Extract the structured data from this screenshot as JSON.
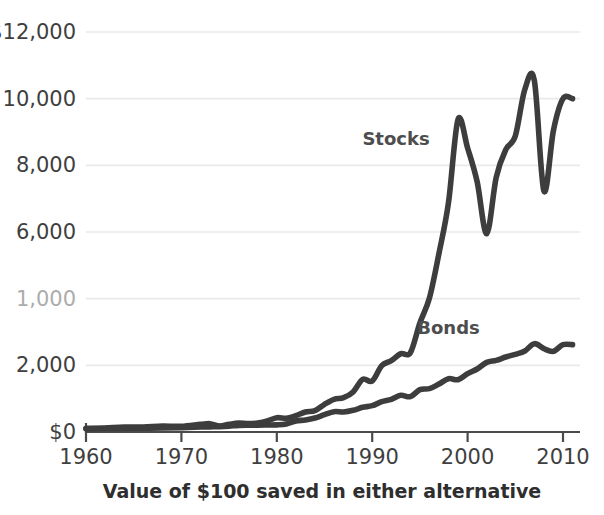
{
  "chart_data": {
    "type": "line",
    "title": "",
    "subtitle": "",
    "caption": "Value of $100 saved in either alternative",
    "xlabel": "",
    "ylabel": "",
    "xlim": [
      1960,
      2011
    ],
    "ylim": [
      0,
      12000
    ],
    "grid": true,
    "legend_position": "inline-annotations",
    "y_ticks": [
      {
        "value": 12000,
        "label": "$12,000",
        "faded": false
      },
      {
        "value": 10000,
        "label": "10,000",
        "faded": false
      },
      {
        "value": 8000,
        "label": "8,000",
        "faded": false
      },
      {
        "value": 6000,
        "label": "6,000",
        "faded": false
      },
      {
        "value": 4000,
        "label": "1,000",
        "faded": true
      },
      {
        "value": 2000,
        "label": "2,000",
        "faded": false
      },
      {
        "value": 0,
        "label": "$0",
        "faded": false
      }
    ],
    "x_ticks": [
      {
        "value": 1960,
        "label": "1960"
      },
      {
        "value": 1970,
        "label": "1970"
      },
      {
        "value": 1980,
        "label": "1980"
      },
      {
        "value": 1990,
        "label": "1990"
      },
      {
        "value": 2000,
        "label": "2000"
      },
      {
        "value": 2010,
        "label": "2010"
      }
    ],
    "annotations": [
      {
        "text": "Stocks",
        "x": 1992.5,
        "y": 8600
      },
      {
        "text": "Bonds",
        "x": 1998.0,
        "y": 2950
      }
    ],
    "series": [
      {
        "name": "Stocks",
        "color": "#3d3d3d",
        "x": [
          1960,
          1962,
          1964,
          1966,
          1968,
          1970,
          1972,
          1973,
          1974,
          1975,
          1976,
          1977,
          1978,
          1979,
          1980,
          1981,
          1982,
          1983,
          1984,
          1985,
          1986,
          1987,
          1988,
          1989,
          1990,
          1991,
          1992,
          1993,
          1994,
          1995,
          1996,
          1997,
          1998,
          1999,
          2000,
          2001,
          2002,
          2003,
          2004,
          2005,
          2006,
          2007,
          2008,
          2009,
          2010,
          2011
        ],
        "values": [
          100,
          120,
          150,
          150,
          175,
          170,
          230,
          250,
          180,
          230,
          270,
          250,
          270,
          330,
          430,
          410,
          490,
          600,
          640,
          830,
          980,
          1030,
          1200,
          1580,
          1530,
          1990,
          2140,
          2350,
          2380,
          3270,
          4020,
          5360,
          6890,
          9380,
          8520,
          7510,
          5950,
          7640,
          8470,
          8880,
          10280,
          10540,
          7230,
          9050,
          10000,
          10000
        ]
      },
      {
        "name": "Bonds",
        "color": "#3d3d3d",
        "x": [
          1960,
          1962,
          1964,
          1966,
          1968,
          1970,
          1972,
          1973,
          1974,
          1975,
          1976,
          1977,
          1978,
          1979,
          1980,
          1981,
          1982,
          1983,
          1984,
          1985,
          1986,
          1987,
          1988,
          1989,
          1990,
          1991,
          1992,
          1993,
          1994,
          1995,
          1996,
          1997,
          1998,
          1999,
          2000,
          2001,
          2002,
          2003,
          2004,
          2005,
          2006,
          2007,
          2008,
          2009,
          2010,
          2011
        ],
        "values": [
          100,
          105,
          110,
          115,
          120,
          130,
          150,
          155,
          160,
          175,
          200,
          205,
          205,
          210,
          215,
          240,
          330,
          360,
          420,
          520,
          610,
          600,
          650,
          740,
          790,
          910,
          980,
          1100,
          1060,
          1270,
          1300,
          1440,
          1600,
          1570,
          1750,
          1890,
          2090,
          2150,
          2250,
          2330,
          2430,
          2650,
          2500,
          2420,
          2620,
          2620
        ]
      }
    ]
  },
  "axis": {
    "y_axis_name": "value-axis",
    "x_axis_name": "year-axis"
  }
}
